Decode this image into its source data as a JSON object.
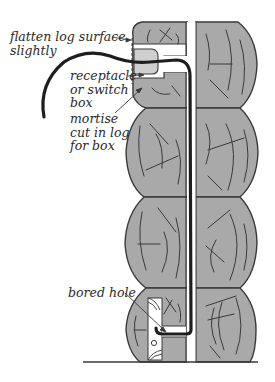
{
  "diagram": {
    "colors": {
      "log_fill": "#a9a9a9",
      "outline": "#3a3a3a",
      "wire": "#1e1e1e",
      "box_fill": "#cfcfcf",
      "background": "#ffffff"
    },
    "labels": {
      "flatten": "flatten log surface\nslightly",
      "receptacle": "receptacle\nor switch\nbox",
      "mortise": "mortise\ncut in log\nfor box",
      "bored_hole": "bored hole"
    },
    "components": [
      {
        "id": "log-stack",
        "description": "four stacked logs in cross-section with center channel"
      },
      {
        "id": "outlet-box",
        "description": "receptacle or switch box set in mortise"
      },
      {
        "id": "electrical-wire",
        "description": "cable running down the channel to a bored hole at the bottom"
      },
      {
        "id": "sill",
        "description": "bottom sill with bored hole"
      }
    ]
  }
}
